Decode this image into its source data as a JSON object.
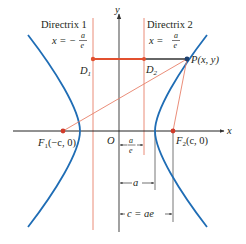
{
  "colors": {
    "curve": "#1f6db5",
    "directrix": "#e8806a",
    "segment": "#e2502f",
    "axis": "#555555",
    "focus": "#d13b2a",
    "text": "#231f20",
    "point_p": "#1c3f6e"
  },
  "axes": {
    "x_label": "x",
    "y_label": "y",
    "origin_label": "O"
  },
  "directrices": [
    {
      "title": "Directrix 1",
      "eq_lhs": "x = −",
      "eq_num": "a",
      "eq_den": "e"
    },
    {
      "title": "Directrix 2",
      "eq_lhs": "x =",
      "eq_num": "a",
      "eq_den": "e"
    }
  ],
  "points": {
    "d1": {
      "letter": "D",
      "sub": "1"
    },
    "d2": {
      "letter": "D",
      "sub": "2"
    },
    "p": {
      "label": "P(x, y)"
    },
    "f1": {
      "letter": "F",
      "sub": "1",
      "coords": "(−c, 0)"
    },
    "f2": {
      "letter": "F",
      "sub": "2",
      "coords": "(c, 0)"
    }
  },
  "measures": [
    {
      "num": "a",
      "den": "e"
    },
    {
      "label": "a"
    },
    {
      "label": "c = ae"
    }
  ]
}
